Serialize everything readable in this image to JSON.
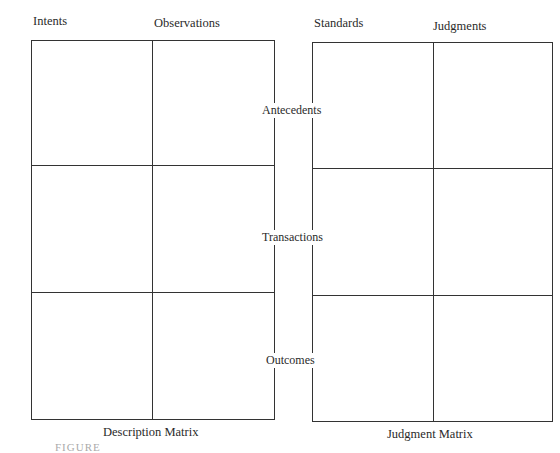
{
  "description_matrix": {
    "title": "Description Matrix",
    "columns": [
      "Intents",
      "Observations"
    ]
  },
  "judgment_matrix": {
    "title": "Judgment Matrix",
    "columns": [
      "Standards",
      "Judgments"
    ]
  },
  "rows": [
    "Antecedents",
    "Transactions",
    "Outcomes"
  ],
  "figure_caption": "FIGURE"
}
